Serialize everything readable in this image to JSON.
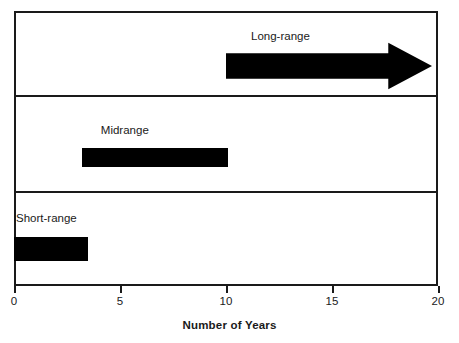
{
  "chart_data": {
    "type": "bar",
    "title": "",
    "xlabel": "Number of Years",
    "ylabel": "",
    "xlim": [
      0,
      20
    ],
    "xticks": [
      0,
      5,
      10,
      15,
      20
    ],
    "xtick_labels": [
      "0",
      "5",
      "10",
      "15",
      "20"
    ],
    "grid": false,
    "legend": "none",
    "orientation": "horizontal",
    "panels": 3,
    "categories": [
      "Short-range",
      "Midrange",
      "Long-range"
    ],
    "series": [
      {
        "name": "Planning horizon",
        "bars": [
          {
            "label": "Short-range",
            "start": 0,
            "end": 3.5,
            "open_ended": false,
            "panel": 3
          },
          {
            "label": "Midrange",
            "start": 3.2,
            "end": 10.1,
            "open_ended": false,
            "panel": 2
          },
          {
            "label": "Long-range",
            "start": 10,
            "end": 20,
            "open_ended": true,
            "panel": 1
          }
        ]
      }
    ]
  },
  "axis": {
    "title": "Number of Years",
    "ticks": [
      {
        "value": "0"
      },
      {
        "value": "5"
      },
      {
        "value": "10"
      },
      {
        "value": "15"
      },
      {
        "value": "20"
      }
    ]
  },
  "labels": {
    "long_range": "Long-range",
    "midrange": "Midrange",
    "short_range": "Short-range"
  },
  "colors": {
    "bar": "#000000",
    "frame": "#1a1a1a",
    "text": "#1a1a1a",
    "background": "#ffffff"
  }
}
